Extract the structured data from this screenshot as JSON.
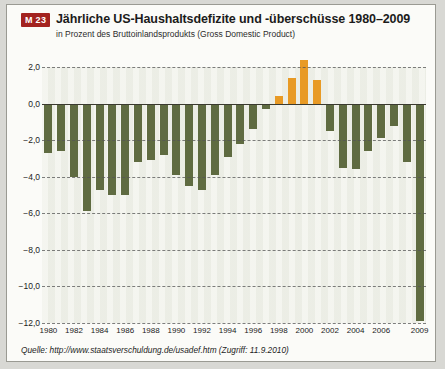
{
  "header": {
    "badge": "M 23",
    "title": "Jährliche US-Haushaltsdefizite und -überschüsse 1980–2009",
    "subtitle": "in Prozent des Bruttoinlandsprodukts (Gross Domestic Product)"
  },
  "source": "Quelle: http://www.staatsverschuldung.de/usadef.htm (Zugriff: 11.9.2010)",
  "colors": {
    "deficit_bar": "#5f6b41",
    "surplus_bar": "#e89a25",
    "badge_bg": "#a32320",
    "panel_bg": "#fbfbf8",
    "page_bg": "#d8d8d4"
  },
  "chart_data": {
    "type": "bar",
    "title": "Jährliche US-Haushaltsdefizite und -überschüsse 1980–2009",
    "subtitle": "in Prozent des Bruttoinlandsprodukts (Gross Domestic Product)",
    "xlabel": "",
    "ylabel": "",
    "ylim": [
      -12.0,
      2.0
    ],
    "yticks": [
      2.0,
      0.0,
      -2.0,
      -4.0,
      -6.0,
      -8.0,
      -10.0,
      -12.0
    ],
    "ytick_labels": [
      "2,0",
      "0,0",
      "−2,0",
      "−4,0",
      "−6,0",
      "−8,0",
      "−10,0",
      "−12,0"
    ],
    "xtick_labels": [
      "1980",
      "1982",
      "1984",
      "1986",
      "1988",
      "1990",
      "1992",
      "1994",
      "1996",
      "1998",
      "2000",
      "2002",
      "2004",
      "2006",
      "2009"
    ],
    "grid": true,
    "legend": "none",
    "categories": [
      "1980",
      "1981",
      "1982",
      "1983",
      "1984",
      "1985",
      "1986",
      "1987",
      "1988",
      "1989",
      "1990",
      "1991",
      "1992",
      "1993",
      "1994",
      "1995",
      "1996",
      "1997",
      "1998",
      "1999",
      "2000",
      "2001",
      "2002",
      "2003",
      "2004",
      "2005",
      "2006",
      "2007",
      "2008",
      "2009"
    ],
    "values": [
      -2.7,
      -2.6,
      -4.0,
      -5.9,
      -4.7,
      -5.0,
      -5.0,
      -3.2,
      -3.1,
      -2.8,
      -3.9,
      -4.5,
      -4.7,
      -3.9,
      -2.9,
      -2.2,
      -1.4,
      -0.3,
      0.4,
      1.4,
      2.4,
      1.3,
      -1.5,
      -3.5,
      -3.6,
      -2.6,
      -1.9,
      -1.2,
      -3.2,
      -11.9
    ]
  }
}
